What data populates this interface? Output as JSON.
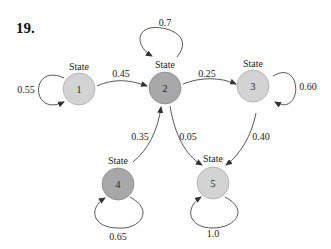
{
  "problem_number": "19.",
  "diagram": {
    "state_word": "State",
    "states": [
      {
        "id": "1",
        "label": "1",
        "shade": "light",
        "color": "#d3d3d3"
      },
      {
        "id": "2",
        "label": "2",
        "shade": "dark",
        "color": "#a8a8a8"
      },
      {
        "id": "3",
        "label": "3",
        "shade": "light",
        "color": "#d3d3d3"
      },
      {
        "id": "4",
        "label": "4",
        "shade": "dark",
        "color": "#a8a8a8"
      },
      {
        "id": "5",
        "label": "5",
        "shade": "light",
        "color": "#d3d3d3"
      }
    ],
    "transitions": [
      {
        "from": "1",
        "to": "1",
        "prob": "0.55"
      },
      {
        "from": "1",
        "to": "2",
        "prob": "0.45"
      },
      {
        "from": "2",
        "to": "2",
        "prob": "0.7"
      },
      {
        "from": "2",
        "to": "3",
        "prob": "0.25"
      },
      {
        "from": "2",
        "to": "5",
        "prob": "0.05"
      },
      {
        "from": "3",
        "to": "3",
        "prob": "0.60"
      },
      {
        "from": "3",
        "to": "5",
        "prob": "0.40"
      },
      {
        "from": "4",
        "to": "2",
        "prob": "0.35"
      },
      {
        "from": "4",
        "to": "4",
        "prob": "0.65"
      },
      {
        "from": "5",
        "to": "5",
        "prob": "1.0"
      }
    ]
  }
}
